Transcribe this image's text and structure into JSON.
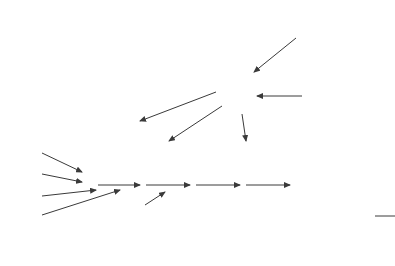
{
  "diagram": {
    "type": "flow",
    "nodes": {
      "stage0": [
        "Stage 0:",
        "Generation",
        "of ideas"
      ],
      "design": [
        "Design",
        "and",
        "redesign"
      ],
      "consumer_research": [
        "Consumer",
        "research"
      ],
      "consumers": "Consumers",
      "suppliers": [
        "Suppliers of",
        "materials and",
        "equipment"
      ],
      "receipt": [
        "Receipt",
        "and test of",
        "materials"
      ],
      "production": "Production,",
      "assembly": "assembly,",
      "inspection": "inspection",
      "distribution": "Distribution",
      "tests": [
        "Tests of processes,",
        "machines, methods,",
        "costs"
      ],
      "suppliers_list": [
        "A",
        "B",
        "C",
        "D"
      ]
    },
    "colors": {
      "line": "#3a3a3a",
      "text": "#2a2a2a",
      "background": "#ffffff"
    }
  }
}
